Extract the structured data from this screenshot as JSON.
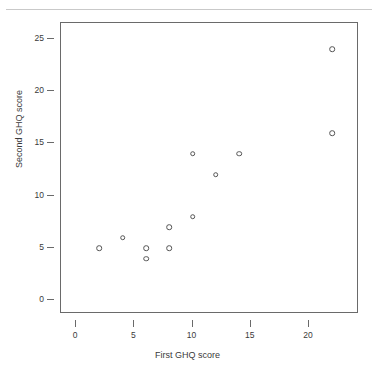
{
  "chart_data": {
    "type": "scatter",
    "title": "",
    "xlabel": "First GHQ score",
    "ylabel": "Second GHQ score",
    "xlim": [
      -1.3,
      24.3
    ],
    "ylim": [
      -1.3,
      26.5
    ],
    "xticks": [
      0,
      5,
      10,
      15,
      20
    ],
    "xticklabels": [
      "0",
      "5",
      "10",
      "15",
      "20"
    ],
    "yticks": [
      0,
      5,
      10,
      15,
      20,
      25
    ],
    "yticklabels": [
      "0",
      "5",
      "10",
      "15",
      "20",
      "25"
    ],
    "grid": false,
    "legend": null,
    "marker": "open-circle",
    "marker_color": "#555555",
    "frame_color": "#6a6a6a",
    "background": "#ffffff",
    "points": [
      {
        "x": 2,
        "y": 5
      },
      {
        "x": 4,
        "y": 6
      },
      {
        "x": 6,
        "y": 5
      },
      {
        "x": 6,
        "y": 4
      },
      {
        "x": 8,
        "y": 7
      },
      {
        "x": 8,
        "y": 5
      },
      {
        "x": 10,
        "y": 8
      },
      {
        "x": 10,
        "y": 14
      },
      {
        "x": 12,
        "y": 12
      },
      {
        "x": 14,
        "y": 14
      },
      {
        "x": 22,
        "y": 16
      },
      {
        "x": 22,
        "y": 24
      }
    ]
  }
}
